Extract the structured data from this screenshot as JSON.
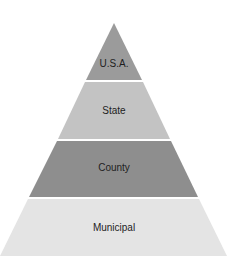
{
  "diagram": {
    "type": "pyramid",
    "levels": [
      {
        "label": "U.S.A.",
        "color": "#9b9b9b"
      },
      {
        "label": "State",
        "color": "#c3c3c3"
      },
      {
        "label": "County",
        "color": "#8e8e8e"
      },
      {
        "label": "Municipal",
        "color": "#e4e4e4"
      }
    ]
  }
}
